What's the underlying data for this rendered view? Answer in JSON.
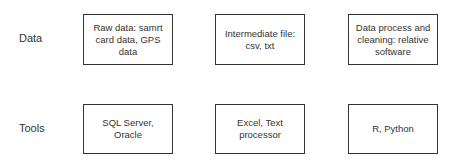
{
  "rows": [
    {
      "label": "Data",
      "boxes": [
        {
          "text": "Raw data: samrt card data, GPS data"
        },
        {
          "text": "Intermediate file: csv, txt"
        },
        {
          "text": "Data process and cleaning: relative software"
        }
      ]
    },
    {
      "label": "Tools",
      "boxes": [
        {
          "text": "SQL Server, Oracle"
        },
        {
          "text": "Excel, Text processor"
        },
        {
          "text": "R, Python"
        }
      ]
    }
  ]
}
